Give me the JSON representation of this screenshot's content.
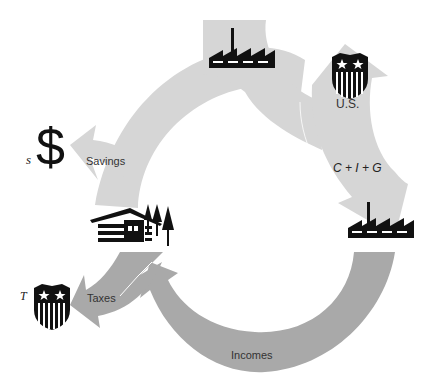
{
  "diagram": {
    "colors": {
      "light_flow": "#d6d6d6",
      "dark_flow": "#a9a9a9",
      "icon": "#111111",
      "background": "#ffffff"
    },
    "nodes": {
      "business_top": {
        "icon": "factory-icon"
      },
      "government_top": {
        "icon": "us-shield-icon",
        "label": "U.S."
      },
      "business_right": {
        "icon": "factory-icon"
      },
      "households": {
        "icon": "house-with-trees-icon"
      },
      "savings": {
        "icon": "dollar-sign-icon",
        "symbol": "$",
        "variable": "s"
      },
      "taxes_gov": {
        "icon": "us-shield-icon",
        "variable": "T"
      }
    },
    "flows": {
      "spending": {
        "label": "C + I + G",
        "color": "light"
      },
      "savings": {
        "label": "Savings",
        "color": "light"
      },
      "taxes": {
        "label": "Taxes",
        "color": "dark"
      },
      "incomes": {
        "label": "Incomes",
        "color": "dark"
      }
    }
  }
}
